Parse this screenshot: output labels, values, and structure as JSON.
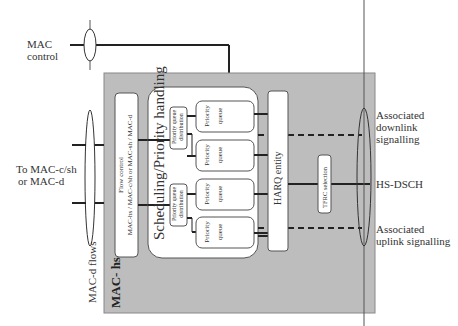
{
  "diagram": {
    "container": {
      "label": "MAC- hs",
      "fill": "#bdbdbd"
    },
    "left_labels": {
      "mac_control": [
        "MAC",
        "control"
      ],
      "to_mac": [
        "To MAC-c/sh",
        "or MAC-d"
      ],
      "mac_d_flows": "MAC-d flows"
    },
    "flow_control": {
      "line1": "Flow control",
      "line2": "MAC-hs / MAC-c/sh or MAC-sh / MAC-d"
    },
    "scheduling": {
      "label": "Scheduling/Priority handling"
    },
    "priority_queue_distribution": [
      "Priority queue distribution",
      "Priority queue distribution"
    ],
    "priority_queues": [
      {
        "line1": "Priority",
        "line2": "queue"
      },
      {
        "line1": "Priority",
        "line2": "queue"
      },
      {
        "line1": "Priority",
        "line2": "queue"
      },
      {
        "line1": "Priority",
        "line2": "queue"
      }
    ],
    "harq": {
      "label": "HARQ entity"
    },
    "tfrc": {
      "label": "TFRC selection"
    },
    "right_labels": {
      "downlink": [
        "Associated",
        "downlink",
        "signalling"
      ],
      "hsdsch": "HS-DSCH",
      "uplink": [
        "Associated",
        "uplink signalling"
      ]
    }
  }
}
